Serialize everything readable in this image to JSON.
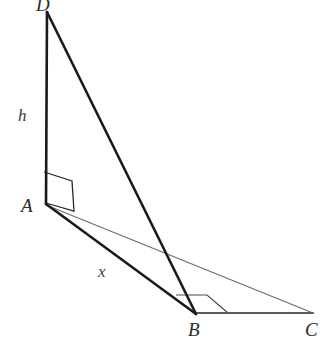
{
  "figure": {
    "background_color": "#ffffff",
    "stroke_dark": "#1a1a1a",
    "stroke_mid": "#4a4a4a",
    "stroke_light": "#6e6e6e"
  },
  "points": {
    "D": {
      "label": "D",
      "x": 47,
      "y": 12
    },
    "A": {
      "label": "A",
      "x": 46,
      "y": 203
    },
    "B": {
      "label": "B",
      "x": 196,
      "y": 313
    },
    "C": {
      "label": "C",
      "x": 313,
      "y": 313
    }
  },
  "segments": [
    {
      "name": "DA",
      "from": "D",
      "to": "A",
      "weight": "thick",
      "color": "#1a1a1a"
    },
    {
      "name": "DB",
      "from": "D",
      "to": "B",
      "weight": "thick",
      "color": "#1a1a1a"
    },
    {
      "name": "AB",
      "from": "A",
      "to": "B",
      "weight": "thick",
      "color": "#1a1a1a"
    },
    {
      "name": "AC",
      "from": "A",
      "to": "C",
      "weight": "thin",
      "color": "#6e6e6e"
    },
    {
      "name": "BC",
      "from": "B",
      "to": "C",
      "weight": "medium",
      "color": "#5a5a5a"
    }
  ],
  "measures": {
    "height": {
      "label": "h",
      "segment": "DA"
    },
    "distance": {
      "label": "x",
      "segment": "AB"
    }
  },
  "right_angles": [
    {
      "name": "right-angle-at-A",
      "at": "A",
      "style": "parallelogram"
    },
    {
      "name": "right-angle-at-B",
      "at": "B",
      "style": "parallelogram"
    }
  ]
}
